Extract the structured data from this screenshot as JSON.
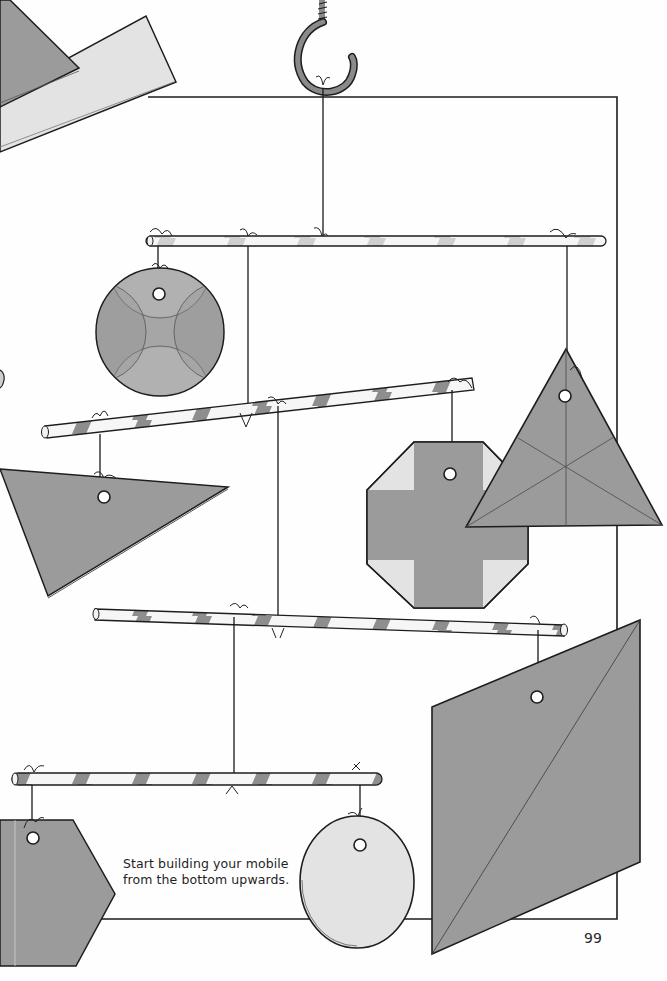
{
  "page": {
    "caption_line1": "Start building your mobile",
    "caption_line2": "from the bottom upwards.",
    "page_number": "99"
  },
  "colors": {
    "dark_card": "#9b9b9b",
    "light_card": "#e3e3e3",
    "outline": "#1d1d1d",
    "rod_stripe": "#8e8e8e",
    "hook": "#8a8a8a"
  },
  "illustration": {
    "subject": "hanging mobile",
    "parts": [
      {
        "name": "ceiling-hook",
        "shape": "hook"
      },
      {
        "name": "rod-1",
        "shape": "striped-straw"
      },
      {
        "name": "rod-2",
        "shape": "striped-straw"
      },
      {
        "name": "rod-3",
        "shape": "striped-straw"
      },
      {
        "name": "rod-4",
        "shape": "striped-straw"
      },
      {
        "name": "circle-card-petal-pattern",
        "shape": "circle"
      },
      {
        "name": "triangle-card-left",
        "shape": "triangle"
      },
      {
        "name": "octagon-card-cross",
        "shape": "octagon"
      },
      {
        "name": "triangle-card-right",
        "shape": "equilateral-triangle"
      },
      {
        "name": "square-card-diagonal",
        "shape": "parallelogram"
      },
      {
        "name": "hexagon-card",
        "shape": "hexagon"
      },
      {
        "name": "oval-card-light",
        "shape": "oval"
      }
    ]
  }
}
